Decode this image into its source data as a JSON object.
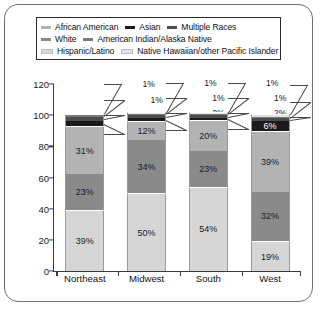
{
  "chart_data": {
    "type": "bar",
    "subtype": "stacked-bar",
    "title": "",
    "xlabel": "",
    "ylabel": "",
    "ylim": [
      0,
      120
    ],
    "yticks": [
      0,
      20,
      40,
      60,
      80,
      100,
      120
    ],
    "grid": false,
    "legend_position": "top",
    "categories": [
      "Northeast",
      "Midwest",
      "South",
      "West"
    ],
    "series": [
      {
        "name": "Hispanic/Latino",
        "color": "#d6d6d6",
        "values": [
          39,
          50,
          54,
          19
        ],
        "labels": [
          "39%",
          "50%",
          "54%",
          "19%"
        ]
      },
      {
        "name": "African American",
        "color": "#8a8a8a",
        "values": [
          23,
          34,
          23,
          32
        ],
        "labels": [
          "23%",
          "34%",
          "23%",
          "32%"
        ]
      },
      {
        "name": "White",
        "color": "#b3b3b3",
        "values": [
          31,
          12,
          20,
          39
        ],
        "labels": [
          "31%",
          "12%",
          "20%",
          "39%"
        ]
      },
      {
        "name": "Asian",
        "color": "#1a1a1a",
        "values": [
          3,
          2,
          1,
          6
        ],
        "labels": [
          "3%",
          "2%",
          "1%",
          "6%"
        ]
      },
      {
        "name": "Multiple Races",
        "color": "#4d4d4d",
        "values": [
          3,
          2,
          2,
          2
        ],
        "labels": [
          "3%",
          "2%",
          "2%",
          "2%"
        ]
      },
      {
        "name": "American Indian/Alaska Native",
        "color": "#7a7a7a",
        "values": [
          1,
          1,
          1,
          1
        ],
        "labels": [
          "1%",
          "1%",
          "1%",
          "1%"
        ]
      },
      {
        "name": "Native Hawaiian/other Pacific Islander",
        "color": "#e2e2e2",
        "values": [
          1,
          1,
          1,
          2
        ],
        "labels": [
          "1%",
          "1%",
          "1%",
          "2%"
        ]
      }
    ]
  },
  "legend": {
    "rows": [
      [
        {
          "label": "African American",
          "color": "#b3b3b3"
        },
        {
          "label": "Asian",
          "color": "#1a1a1a"
        },
        {
          "label": "Multiple Races",
          "color": "#4d4d4d"
        }
      ],
      [
        {
          "label": "White",
          "color": "#8a8a8a"
        },
        {
          "label": "American Indian/Alaska Native",
          "color": "#7a7a7a"
        }
      ],
      [
        {
          "label": "Hispanic/Latino",
          "color": "#d6d6d6"
        },
        {
          "label": "Native Hawaiian/other Pacific Islander",
          "color": "#e2e2e2"
        }
      ]
    ]
  }
}
